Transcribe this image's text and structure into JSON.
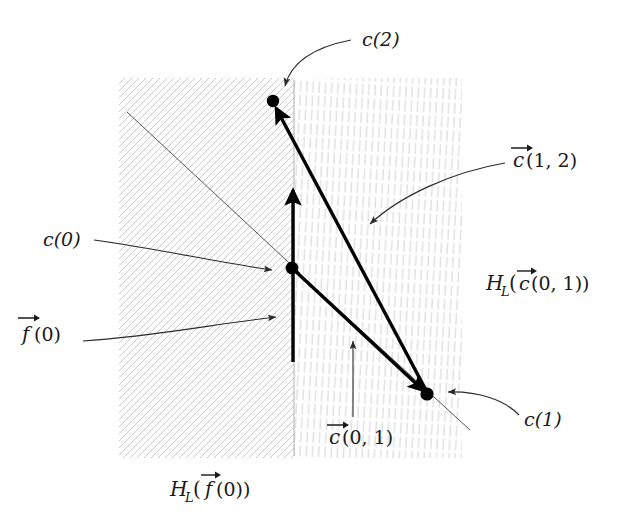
{
  "figure": {
    "type": "diagram",
    "title_text": "",
    "background_color": "#ffffff",
    "ink_color": "#000000",
    "hatch_color": "#b9b9b9",
    "width": 620,
    "height": 518,
    "labels": {
      "c2": "c(2)",
      "c0": "c(0)",
      "c1": "c(1)",
      "f0_vec_base": "f",
      "f0_vec_args": "(0)",
      "c12_vec_base": "c",
      "c12_vec_args": "(1, 2)",
      "c01_vec_base": "c",
      "c01_vec_args": "(0, 1)",
      "halfplane_c01_head": "H",
      "halfplane_c01_sub": "L",
      "halfplane_c01_open": "(",
      "halfplane_c01_base": "c",
      "halfplane_c01_args": "(0, 1))",
      "halfplane_f0_head": "H",
      "halfplane_f0_sub": "L",
      "halfplane_f0_open": "(",
      "halfplane_f0_base": "f",
      "halfplane_f0_args": "(0))"
    },
    "regions": [
      {
        "name": "left-halfplane-region",
        "label": "H_L(f(0))",
        "hatch_style": "diagonal-45-down-right",
        "x": 119,
        "y": 78,
        "width": 175,
        "height": 380
      },
      {
        "name": "right-halfplane-region",
        "label": "H_L(c(0,1))",
        "hatch_style": "near-vertical",
        "x": 294,
        "y": 78,
        "width": 168,
        "height": 380
      }
    ],
    "points": [
      {
        "name": "c(2)",
        "x": 273,
        "y": 101
      },
      {
        "name": "c(0)",
        "x": 292,
        "y": 268
      },
      {
        "name": "c(1)",
        "x": 427,
        "y": 394
      }
    ],
    "vectors": [
      {
        "name": "c(0,1)",
        "from": "c(0)",
        "to": "c(1)"
      },
      {
        "name": "c(1,2)",
        "from": "c(1)",
        "to": "c(2)"
      },
      {
        "name": "f(0)",
        "from": "c(0)",
        "to": "upward along boundary"
      }
    ]
  }
}
